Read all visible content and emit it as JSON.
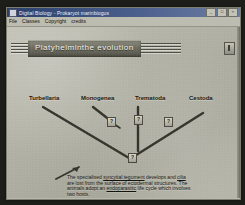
{
  "window": {
    "title": "Digital Biology - Prokaryot marinbiogus",
    "icon": "app-icon",
    "controls": [
      {
        "name": "minimize",
        "glyph": "_"
      },
      {
        "name": "maximize",
        "glyph": "□"
      },
      {
        "name": "close",
        "glyph": "×"
      }
    ]
  },
  "menu": {
    "items": [
      "File",
      "Classes",
      "Copyright",
      "credits"
    ]
  },
  "banner": {
    "title": "Platyhelminthe evolution",
    "corner_icon": "settings-icon"
  },
  "diagram": {
    "taxa": [
      {
        "label": "Turbellaria",
        "x": 22,
        "y": 72
      },
      {
        "label": "Monogenea",
        "x": 76,
        "y": 72
      },
      {
        "label": "Trematoda",
        "x": 130,
        "y": 72
      },
      {
        "label": "Cestoda",
        "x": 184,
        "y": 72
      }
    ],
    "nodes": [
      {
        "name": "node-monogenea",
        "glyph": "?",
        "x": 100,
        "y": 91
      },
      {
        "name": "node-trematoda",
        "glyph": "?",
        "x": 128,
        "y": 89
      },
      {
        "name": "node-cestoda",
        "glyph": "?",
        "x": 158,
        "y": 91
      },
      {
        "name": "node-root",
        "glyph": "?",
        "x": 124,
        "y": 128
      }
    ]
  },
  "description": {
    "line1_a": "The specialised ",
    "line1_link1": "syncytial tegument",
    "line1_b": " develops and ",
    "line1_link2": "cilia",
    "line2": " are lost from the surface of ectodermal structures. The",
    "line3_a": " animals adopt an ",
    "line3_link": "endoparasitic",
    "line3_b": " life cycle which involves",
    "line4": "two hosts."
  },
  "colors": {
    "titlebar_start": "#2b3f6b",
    "titlebar_end": "#6d7ea3",
    "banner_fill": "#6e6d61",
    "canvas": "#b3b2a6",
    "ink": "#16160f"
  }
}
